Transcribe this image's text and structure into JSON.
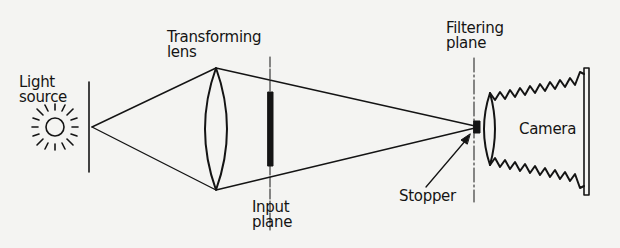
{
  "diagram": {
    "colors": {
      "ink": "#141414",
      "background": "#f4f4f2"
    },
    "labels": {
      "light_source": [
        "Light",
        "source"
      ],
      "transforming_lens": [
        "Transforming",
        "lens"
      ],
      "input_plane": [
        "Input",
        "plane"
      ],
      "filtering_plane": [
        "Filtering",
        "plane"
      ],
      "stopper": "Stopper",
      "camera": "Camera"
    },
    "components": [
      {
        "id": "light-source",
        "icon": "sun-icon"
      },
      {
        "id": "transforming-lens",
        "icon": "convex-lens-icon"
      },
      {
        "id": "input-plane",
        "icon": "slide-bar-icon"
      },
      {
        "id": "filtering-plane",
        "icon": "dash-dot-line"
      },
      {
        "id": "stopper",
        "icon": "block-icon"
      },
      {
        "id": "camera",
        "icon": "bellows-camera-icon"
      }
    ]
  }
}
